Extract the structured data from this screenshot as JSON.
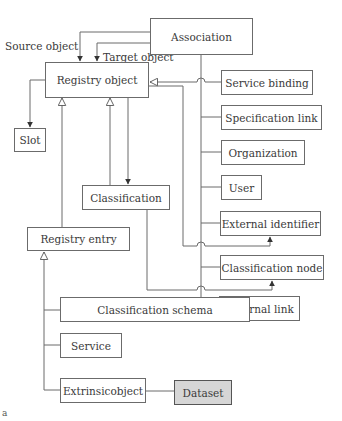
{
  "diagram": {
    "boxes": {
      "association": "Association",
      "registry_object": "Registry object",
      "slot": "Slot",
      "classification": "Classification",
      "registry_entry": "Registry entry",
      "service_binding": "Service binding",
      "specification_link": "Specification link",
      "organization": "Organization",
      "user": "User",
      "external_identifier": "External identifier",
      "classification_node": "Classification node",
      "external_link": "External link",
      "classification_schema": "Classification schema",
      "service": "Service",
      "extrinsic_object": "Extrinsicobject",
      "dataset": "Dataset"
    },
    "edge_labels": {
      "source_object": "Source object",
      "target_object": "Target object"
    },
    "figure_marker": "a",
    "colors": {
      "line": "#6b6b6b",
      "box_border": "#6b6b6b",
      "dataset_fill": "#d6d6d6",
      "text": "#3a3a3a"
    }
  }
}
